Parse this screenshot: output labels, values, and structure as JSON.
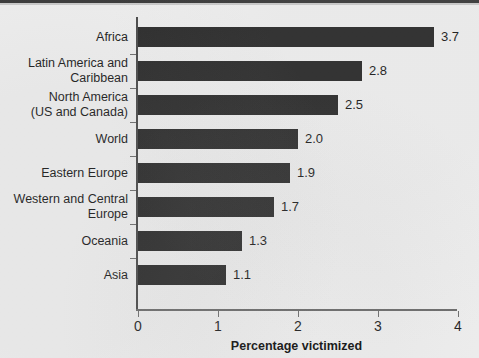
{
  "chart_data": {
    "type": "bar",
    "orientation": "horizontal",
    "title": "",
    "xlabel": "Percentage victimized",
    "ylabel": "",
    "xlim": [
      0,
      4
    ],
    "xticks": [
      "0",
      "1",
      "2",
      "3",
      "4"
    ],
    "grid": false,
    "legend": null,
    "bar_color": "#2b2b2b",
    "categories": [
      "Africa",
      "Latin America and\nCaribbean",
      "North America\n(US and Canada)",
      "World",
      "Eastern Europe",
      "Western and Central\nEurope",
      "Oceania",
      "Asia"
    ],
    "values": [
      3.7,
      2.8,
      2.5,
      2.0,
      1.9,
      1.7,
      1.3,
      1.1
    ],
    "value_labels": [
      "3.7",
      "2.8",
      "2.5",
      "2.0",
      "1.9",
      "1.7",
      "1.3",
      "1.1"
    ]
  },
  "colors": {
    "background": "#eeeeee",
    "bar": "#2b2b2b",
    "axis": "#4a4a4a",
    "text": "#1b1b1b"
  }
}
